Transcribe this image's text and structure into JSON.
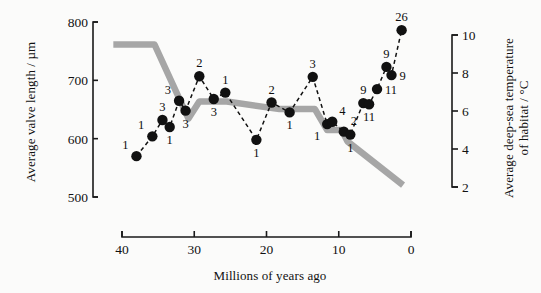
{
  "figure": {
    "background_color": "#fbfbfa",
    "xlabel": "Millions of years ago",
    "ylabel_left": "Average valve length / µm",
    "ylabel_right_line1": "Average deep-sea temperature",
    "ylabel_right_line2": "of habitat / °C"
  },
  "chart_data": {
    "type": "line",
    "title": "",
    "xlabel": "Millions of years ago",
    "ylabel": "Average valve length / µm",
    "ylabel_secondary": "Average deep-sea temperature of habitat / °C",
    "grid": false,
    "legend": null,
    "xlim": [
      42,
      0
    ],
    "x_reversed": true,
    "xticks": [
      40,
      30,
      20,
      10,
      0
    ],
    "ylim_left": [
      500,
      800
    ],
    "yticks_left": [
      500,
      600,
      700,
      800
    ],
    "ylim_right": [
      2,
      10
    ],
    "yticks_right": [
      2,
      4,
      6,
      8,
      10
    ],
    "series": [
      {
        "name": "Average valve length",
        "axis": "left",
        "style": "dashed-with-markers",
        "color": "#111111",
        "marker": "filled-circle",
        "point_labels_meaning": "number of species sampled",
        "points": [
          {
            "x": 38.0,
            "y": 570,
            "label": "1",
            "label_pos": "above-left"
          },
          {
            "x": 35.8,
            "y": 604,
            "label": "1",
            "label_pos": "above-left"
          },
          {
            "x": 34.4,
            "y": 632,
            "label": "3",
            "label_pos": "above"
          },
          {
            "x": 33.4,
            "y": 620,
            "label": "1",
            "label_pos": "below"
          },
          {
            "x": 32.1,
            "y": 665,
            "label": "3",
            "label_pos": "above-left"
          },
          {
            "x": 31.2,
            "y": 648,
            "label": "3",
            "label_pos": "below"
          },
          {
            "x": 29.3,
            "y": 707,
            "label": "2",
            "label_pos": "above"
          },
          {
            "x": 27.3,
            "y": 668,
            "label": "3",
            "label_pos": "below"
          },
          {
            "x": 25.7,
            "y": 679,
            "label": "1",
            "label_pos": "above"
          },
          {
            "x": 21.4,
            "y": 598,
            "label": "1",
            "label_pos": "below"
          },
          {
            "x": 19.3,
            "y": 662,
            "label": "2",
            "label_pos": "above"
          },
          {
            "x": 16.8,
            "y": 645,
            "label": "1",
            "label_pos": "below"
          },
          {
            "x": 13.6,
            "y": 706,
            "label": "3",
            "label_pos": "above"
          },
          {
            "x": 11.6,
            "y": 625,
            "label": "1",
            "label_pos": "below-left"
          },
          {
            "x": 10.9,
            "y": 629,
            "label": "4",
            "label_pos": "above-right"
          },
          {
            "x": 9.3,
            "y": 612,
            "label": "2",
            "label_pos": "above-right"
          },
          {
            "x": 8.4,
            "y": 607,
            "label": "1",
            "label_pos": "below"
          },
          {
            "x": 6.6,
            "y": 661,
            "label": "9",
            "label_pos": "above"
          },
          {
            "x": 5.8,
            "y": 659,
            "label": "11",
            "label_pos": "below"
          },
          {
            "x": 4.7,
            "y": 685,
            "label": "11",
            "label_pos": "right"
          },
          {
            "x": 3.4,
            "y": 723,
            "label": "9",
            "label_pos": "above"
          },
          {
            "x": 2.7,
            "y": 709,
            "label": "9",
            "label_pos": "right"
          },
          {
            "x": 1.3,
            "y": 786,
            "label": "26",
            "label_pos": "above"
          }
        ]
      },
      {
        "name": "Average deep-sea temperature of habitat",
        "axis": "right",
        "style": "solid-thick",
        "color": "#a6a6a6",
        "vertices": [
          {
            "x": 41.2,
            "t": 9.5
          },
          {
            "x": 35.5,
            "t": 9.5
          },
          {
            "x": 30.8,
            "t": 5.6
          },
          {
            "x": 29.3,
            "t": 6.5
          },
          {
            "x": 25.5,
            "t": 6.5
          },
          {
            "x": 18.2,
            "t": 6.1
          },
          {
            "x": 13.3,
            "t": 6.1
          },
          {
            "x": 11.6,
            "t": 5.0
          },
          {
            "x": 9.6,
            "t": 5.0
          },
          {
            "x": 8.8,
            "t": 4.4
          },
          {
            "x": 1.1,
            "t": 2.1
          }
        ]
      }
    ]
  }
}
